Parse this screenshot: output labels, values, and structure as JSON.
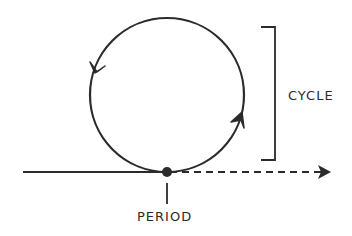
{
  "diagram": {
    "labels": {
      "cycle": "CYCLE",
      "period": "PERIOD"
    },
    "colors": {
      "stroke": "#2b2b2b",
      "background": "#ffffff"
    }
  }
}
